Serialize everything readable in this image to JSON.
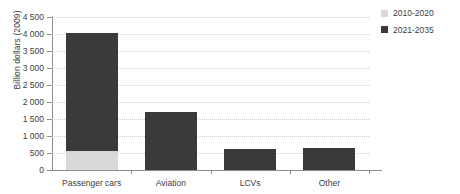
{
  "chart_data": {
    "type": "bar",
    "title": "",
    "subtitle": "",
    "xlabel": "",
    "ylabel": "Billion  dollars (2009)",
    "categories": [
      "Passenger cars",
      "Aviation",
      "LCVs",
      "Other"
    ],
    "series": [
      {
        "name": "2010-2020",
        "color": "#d9d9d9",
        "values": [
          560,
          0,
          0,
          0
        ]
      },
      {
        "name": "2021-2035",
        "color": "#3a3a3a",
        "values": [
          3470,
          1720,
          630,
          650
        ]
      }
    ],
    "totals": [
      4030,
      1720,
      630,
      650
    ],
    "stacked": true,
    "ylim": [
      0,
      4500
    ],
    "ytick_values": [
      0,
      500,
      1000,
      1500,
      2000,
      2500,
      3000,
      3500,
      4000,
      4500
    ],
    "ytick_labels": [
      "0",
      "500",
      "1 000",
      "1 500",
      "2 000",
      "2 500",
      "3 000",
      "3 500",
      "4 000",
      "4 500"
    ],
    "grid": true,
    "grid_style": "dotted",
    "grid_color": "#d0d0d0",
    "legend_position": "top-right",
    "axis_color": "#8c8c8c",
    "text_color": "#3d3d3d",
    "background": "#ffffff"
  },
  "legend": {
    "entries": [
      {
        "label": "2010-2020",
        "color": "#d9d9d9"
      },
      {
        "label": "2021-2035",
        "color": "#3a3a3a"
      }
    ]
  }
}
